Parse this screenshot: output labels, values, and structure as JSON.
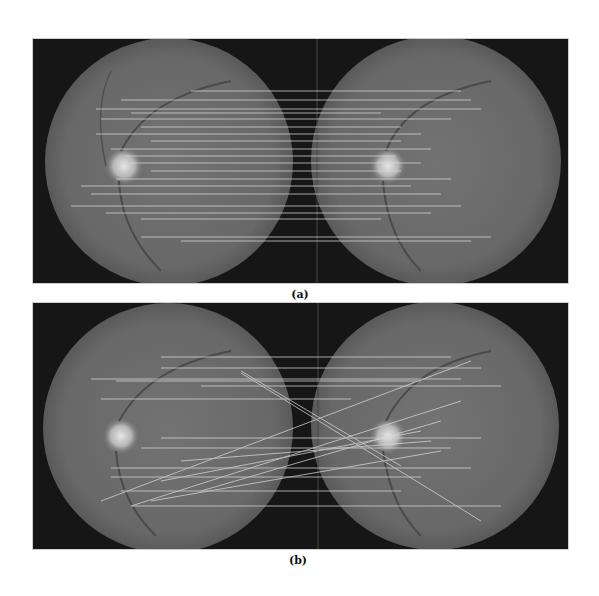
{
  "figure": {
    "panels": [
      {
        "id": "a",
        "caption": "(a)",
        "description": "Fundus image pair with horizontal keypoint correspondence lines (correct matches)",
        "left_eye": {
          "label": "fundus-image-left"
        },
        "right_eye": {
          "label": "fundus-image-right"
        }
      },
      {
        "id": "b",
        "caption": "(b)",
        "description": "Fundus image pair with keypoint correspondence lines including crossing mismatches",
        "left_eye": {
          "label": "fundus-image-left"
        },
        "right_eye": {
          "label": "fundus-image-right"
        }
      }
    ],
    "watermark": "Article Watermark"
  },
  "colors": {
    "panel_background": "#161616",
    "retina_fill": "#6b6b6b",
    "retina_edge": "#5a5a5a",
    "optic_disc": "#d9d9d9",
    "match_line": "#d8d8d8",
    "page_background": "#ffffff"
  }
}
